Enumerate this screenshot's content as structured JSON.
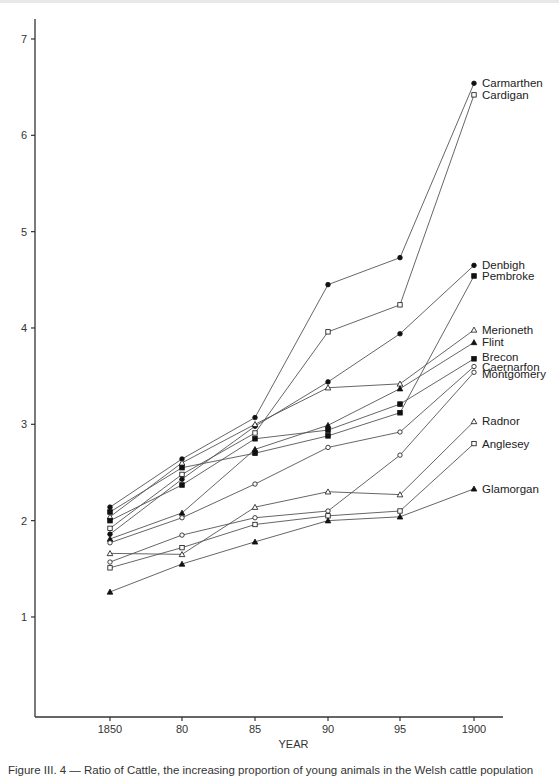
{
  "chart_data": {
    "type": "line",
    "title": "",
    "xlabel": "YEAR",
    "ylabel": "",
    "x": [
      "1850",
      "80",
      "85",
      "90",
      "95",
      "1900"
    ],
    "x_values": [
      1850,
      1880,
      1885,
      1890,
      1895,
      1900
    ],
    "yticks": [
      1,
      2,
      3,
      4,
      5,
      6,
      7
    ],
    "ylim": [
      0,
      7.2
    ],
    "grid": false,
    "legend_position": "inline-right",
    "series": [
      {
        "name": "Carmarthen",
        "marker": "filled-circle",
        "values": [
          2.14,
          2.64,
          3.07,
          4.45,
          4.73,
          6.54
        ]
      },
      {
        "name": "Cardigan",
        "marker": "open-square",
        "values": [
          1.92,
          2.48,
          2.91,
          3.96,
          4.24,
          6.42
        ]
      },
      {
        "name": "Denbigh",
        "marker": "filled-circle",
        "values": [
          1.86,
          2.43,
          2.98,
          3.44,
          3.94,
          4.65
        ]
      },
      {
        "name": "Pembroke",
        "marker": "filled-square",
        "values": [
          2.09,
          2.55,
          2.7,
          2.88,
          3.12,
          4.54
        ]
      },
      {
        "name": "Merioneth",
        "marker": "open-triangle",
        "values": [
          2.04,
          2.6,
          3.0,
          3.38,
          3.42,
          3.98
        ]
      },
      {
        "name": "Flint",
        "marker": "filled-triangle",
        "values": [
          1.81,
          2.08,
          2.74,
          2.99,
          3.37,
          3.85
        ]
      },
      {
        "name": "Brecon",
        "marker": "filled-square",
        "values": [
          2.0,
          2.37,
          2.85,
          2.94,
          3.21,
          3.68
        ]
      },
      {
        "name": "Caernarfon",
        "marker": "open-circle",
        "values": [
          1.77,
          2.03,
          2.38,
          2.76,
          2.92,
          3.6
        ]
      },
      {
        "name": "Montgomery",
        "marker": "open-circle",
        "values": [
          1.57,
          1.85,
          2.03,
          2.1,
          2.68,
          3.54
        ]
      },
      {
        "name": "Radnor",
        "marker": "open-triangle",
        "values": [
          1.66,
          1.65,
          2.14,
          2.3,
          2.27,
          3.03
        ]
      },
      {
        "name": "Anglesey",
        "marker": "open-square",
        "values": [
          1.51,
          1.72,
          1.96,
          2.05,
          2.1,
          2.8
        ]
      },
      {
        "name": "Glamorgan",
        "marker": "filled-triangle",
        "values": [
          1.26,
          1.55,
          1.78,
          2.0,
          2.04,
          2.33
        ]
      }
    ],
    "caption": "Figure III. 4 — Ratio of Cattle, the increasing proportion of young animals in the Welsh cattle population"
  },
  "layout": {
    "x_pixels": [
      110,
      182,
      255,
      328,
      400,
      474
    ],
    "y_zero_px": 713.3,
    "px_per_unit": 96.33,
    "label_offsets": {
      "Brecon": -2,
      "Caernarfon": 0,
      "Montgomery": 2
    }
  }
}
